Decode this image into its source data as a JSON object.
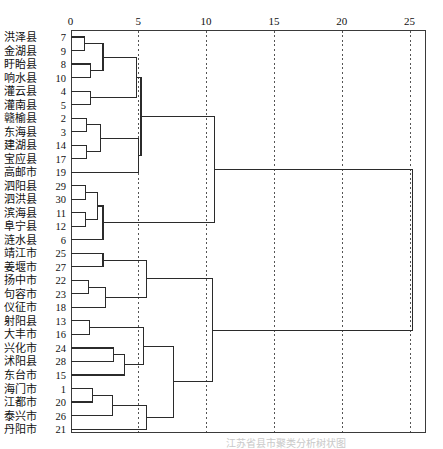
{
  "figure": {
    "title": "",
    "caption": "江苏省县市聚类分析树状图"
  },
  "axis": {
    "ticks": [
      0,
      5,
      10,
      15,
      20,
      25
    ],
    "tick_labels": [
      "0",
      "5",
      "10",
      "15",
      "20",
      "25"
    ],
    "range": [
      0,
      26.5
    ],
    "position": "top",
    "grid": "dotted-vertical"
  },
  "colors": {
    "line": "#2b2b2b",
    "grid": "#555555",
    "border": "#3a3a3a",
    "text": "#111111",
    "background": "#ffffff"
  },
  "chart_data": {
    "type": "dendrogram",
    "title": "",
    "xlabel": "",
    "ylabel": "",
    "xlim": [
      0,
      26.5
    ],
    "grid": true,
    "legend": "none",
    "orientation": "horizontal",
    "axis_position": "top",
    "leaves": [
      {
        "name": "洪泽县",
        "id": 7
      },
      {
        "name": "金湖县",
        "id": 9
      },
      {
        "name": "盱眙县",
        "id": 8
      },
      {
        "name": "响水县",
        "id": 10
      },
      {
        "name": "灌云县",
        "id": 4
      },
      {
        "name": "灌南县",
        "id": 5
      },
      {
        "name": "赣榆县",
        "id": 2
      },
      {
        "name": "东海县",
        "id": 3
      },
      {
        "name": "建湖县",
        "id": 14
      },
      {
        "name": "宝应县",
        "id": 17
      },
      {
        "name": "高邮市",
        "id": 19
      },
      {
        "name": "泗阳县",
        "id": 29
      },
      {
        "name": "泗洪县",
        "id": 30
      },
      {
        "name": "滨海县",
        "id": 11
      },
      {
        "name": "阜宁县",
        "id": 12
      },
      {
        "name": "涟水县",
        "id": 6
      },
      {
        "name": "靖江市",
        "id": 25
      },
      {
        "name": "姜堰市",
        "id": 27
      },
      {
        "name": "扬中市",
        "id": 22
      },
      {
        "name": "句容市",
        "id": 23
      },
      {
        "name": "仪征市",
        "id": 18
      },
      {
        "name": "射阳县",
        "id": 13
      },
      {
        "name": "大丰市",
        "id": 16
      },
      {
        "name": "兴化市",
        "id": 24
      },
      {
        "name": "沭阳县",
        "id": 28
      },
      {
        "name": "东台市",
        "id": 15
      },
      {
        "name": "海门市",
        "id": 1
      },
      {
        "name": "江都市",
        "id": 20
      },
      {
        "name": "泰兴市",
        "id": 26
      },
      {
        "name": "丹阳市",
        "id": 21
      }
    ],
    "merges": [
      {
        "id": "m1",
        "left": "leaf:0",
        "right": "leaf:1",
        "height": 1.0
      },
      {
        "id": "m2",
        "left": "leaf:2",
        "right": "leaf:3",
        "height": 1.5
      },
      {
        "id": "m3",
        "left": "m1",
        "right": "m2",
        "height": 2.4
      },
      {
        "id": "m4",
        "left": "leaf:4",
        "right": "leaf:5",
        "height": 1.5
      },
      {
        "id": "m5",
        "left": "m3",
        "right": "m4",
        "height": 4.9
      },
      {
        "id": "m6",
        "left": "leaf:6",
        "right": "leaf:7",
        "height": 1.2
      },
      {
        "id": "m7",
        "left": "leaf:8",
        "right": "leaf:9",
        "height": 1.2
      },
      {
        "id": "m8",
        "left": "m6",
        "right": "m7",
        "height": 2.2
      },
      {
        "id": "m9",
        "left": "m8",
        "right": "leaf:10",
        "height": 5.0
      },
      {
        "id": "m10",
        "left": "m5",
        "right": "m9",
        "height": 5.2
      },
      {
        "id": "m11",
        "left": "leaf:11",
        "right": "leaf:12",
        "height": 1.1
      },
      {
        "id": "m12",
        "left": "leaf:13",
        "right": "leaf:14",
        "height": 1.1
      },
      {
        "id": "m13",
        "left": "m11",
        "right": "m12",
        "height": 2.0
      },
      {
        "id": "m14",
        "left": "m13",
        "right": "leaf:15",
        "height": 2.4
      },
      {
        "id": "m15",
        "left": "m10",
        "right": "m14",
        "height": 10.6
      },
      {
        "id": "m16",
        "left": "leaf:16",
        "right": "leaf:17",
        "height": 2.4
      },
      {
        "id": "m17",
        "left": "leaf:18",
        "right": "leaf:19",
        "height": 1.3
      },
      {
        "id": "m18",
        "left": "m17",
        "right": "leaf:20",
        "height": 2.6
      },
      {
        "id": "m19",
        "left": "m16",
        "right": "m18",
        "height": 5.6
      },
      {
        "id": "m20",
        "left": "leaf:21",
        "right": "leaf:22",
        "height": 1.4
      },
      {
        "id": "m21",
        "left": "leaf:23",
        "right": "leaf:24",
        "height": 3.2
      },
      {
        "id": "m22",
        "left": "m21",
        "right": "leaf:25",
        "height": 4.0
      },
      {
        "id": "m23",
        "left": "m20",
        "right": "m22",
        "height": 5.4
      },
      {
        "id": "m24",
        "left": "leaf:26",
        "right": "leaf:27",
        "height": 1.6
      },
      {
        "id": "m25",
        "left": "m24",
        "right": "leaf:28",
        "height": 3.1
      },
      {
        "id": "m26",
        "left": "m25",
        "right": "leaf:29",
        "height": 5.6
      },
      {
        "id": "m27",
        "left": "m23",
        "right": "m26",
        "height": 7.6
      },
      {
        "id": "m28",
        "left": "m19",
        "right": "m27",
        "height": 10.5
      },
      {
        "id": "m29",
        "left": "m15",
        "right": "m28",
        "height": 25.2
      }
    ]
  }
}
